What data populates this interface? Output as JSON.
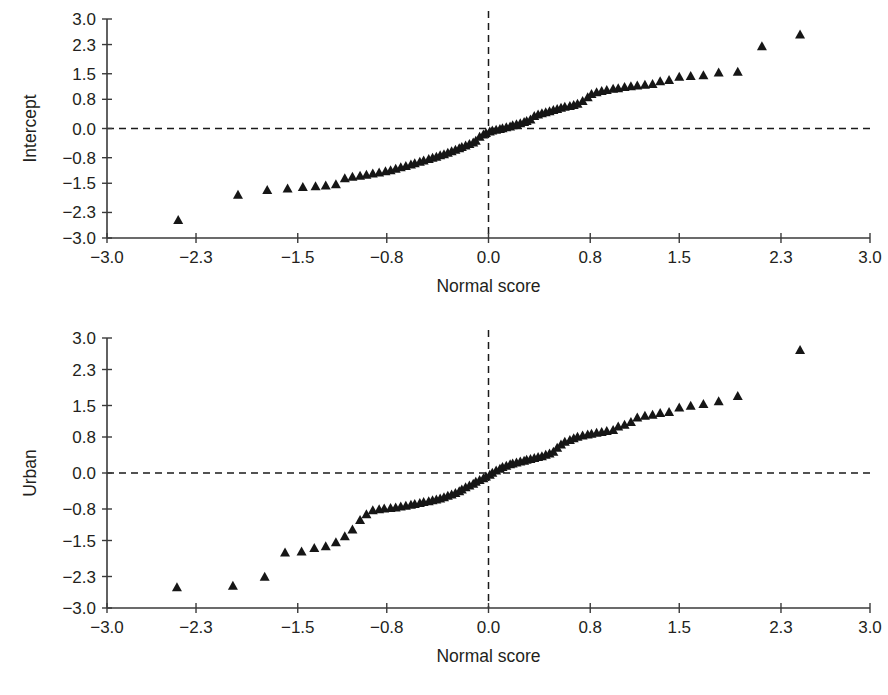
{
  "figure": {
    "background_color": "#ffffff",
    "marker_color": "#161616",
    "axis_color": "#3a3a3a"
  },
  "chart_data": [
    {
      "type": "scatter",
      "title": "",
      "subtitle": "",
      "xlabel": "Normal score",
      "ylabel": "Intercept",
      "xlim": [
        -3.0,
        3.0
      ],
      "ylim": [
        -3.0,
        3.0
      ],
      "xticks": [
        -3.0,
        -2.3,
        -1.5,
        -0.8,
        0.0,
        0.8,
        1.5,
        2.3,
        3.0
      ],
      "yticks": [
        -3.0,
        -2.3,
        -1.5,
        -0.8,
        0.0,
        0.8,
        1.5,
        2.3,
        3.0
      ],
      "xtick_labels": [
        "−3.0",
        "−2.3",
        "−1.5",
        "−0.8",
        "0.0",
        "0.8",
        "1.5",
        "2.3",
        "3.0"
      ],
      "ytick_labels": [
        "−3.0",
        "−2.3",
        "−1.5",
        "−0.8",
        "0.0",
        "0.8",
        "1.5",
        "2.3",
        "3.0"
      ],
      "grid": false,
      "legend": null,
      "annotations": [
        {
          "name": "horizontal-zero-reference",
          "type": "hline",
          "y": 0.0,
          "style": "dashed"
        },
        {
          "name": "vertical-zero-reference",
          "type": "vline",
          "x": 0.0,
          "style": "dashed"
        }
      ],
      "marker": "triangle-up",
      "points": [
        [
          -2.44,
          -2.52
        ],
        [
          -1.97,
          -1.83
        ],
        [
          -1.74,
          -1.7
        ],
        [
          -1.58,
          -1.66
        ],
        [
          -1.46,
          -1.62
        ],
        [
          -1.36,
          -1.6
        ],
        [
          -1.28,
          -1.58
        ],
        [
          -1.2,
          -1.54
        ],
        [
          -1.13,
          -1.38
        ],
        [
          -1.07,
          -1.34
        ],
        [
          -1.01,
          -1.31
        ],
        [
          -0.96,
          -1.28
        ],
        [
          -0.91,
          -1.25
        ],
        [
          -0.86,
          -1.22
        ],
        [
          -0.81,
          -1.19
        ],
        [
          -0.77,
          -1.16
        ],
        [
          -0.73,
          -1.12
        ],
        [
          -0.69,
          -1.08
        ],
        [
          -0.65,
          -1.04
        ],
        [
          -0.61,
          -1.0
        ],
        [
          -0.58,
          -0.97
        ],
        [
          -0.54,
          -0.93
        ],
        [
          -0.51,
          -0.89
        ],
        [
          -0.47,
          -0.85
        ],
        [
          -0.44,
          -0.82
        ],
        [
          -0.41,
          -0.79
        ],
        [
          -0.38,
          -0.75
        ],
        [
          -0.35,
          -0.72
        ],
        [
          -0.32,
          -0.68
        ],
        [
          -0.29,
          -0.64
        ],
        [
          -0.26,
          -0.6
        ],
        [
          -0.23,
          -0.56
        ],
        [
          -0.21,
          -0.52
        ],
        [
          -0.18,
          -0.48
        ],
        [
          -0.15,
          -0.44
        ],
        [
          -0.12,
          -0.4
        ],
        [
          -0.1,
          -0.35
        ],
        [
          -0.07,
          -0.24
        ],
        [
          -0.04,
          -0.18
        ],
        [
          -0.02,
          -0.14
        ],
        [
          0.01,
          -0.1
        ],
        [
          0.03,
          -0.07
        ],
        [
          0.06,
          -0.05
        ],
        [
          0.09,
          -0.03
        ],
        [
          0.11,
          -0.01
        ],
        [
          0.14,
          0.02
        ],
        [
          0.17,
          0.04
        ],
        [
          0.19,
          0.07
        ],
        [
          0.22,
          0.1
        ],
        [
          0.25,
          0.13
        ],
        [
          0.28,
          0.16
        ],
        [
          0.3,
          0.19
        ],
        [
          0.33,
          0.23
        ],
        [
          0.36,
          0.33
        ],
        [
          0.39,
          0.37
        ],
        [
          0.42,
          0.4
        ],
        [
          0.45,
          0.43
        ],
        [
          0.48,
          0.46
        ],
        [
          0.51,
          0.49
        ],
        [
          0.54,
          0.52
        ],
        [
          0.57,
          0.55
        ],
        [
          0.6,
          0.58
        ],
        [
          0.64,
          0.6
        ],
        [
          0.67,
          0.63
        ],
        [
          0.7,
          0.66
        ],
        [
          0.74,
          0.74
        ],
        [
          0.78,
          0.84
        ],
        [
          0.81,
          0.93
        ],
        [
          0.85,
          0.98
        ],
        [
          0.89,
          1.01
        ],
        [
          0.93,
          1.04
        ],
        [
          0.98,
          1.07
        ],
        [
          1.02,
          1.09
        ],
        [
          1.07,
          1.12
        ],
        [
          1.12,
          1.14
        ],
        [
          1.17,
          1.16
        ],
        [
          1.23,
          1.18
        ],
        [
          1.29,
          1.2
        ],
        [
          1.35,
          1.28
        ],
        [
          1.42,
          1.31
        ],
        [
          1.5,
          1.4
        ],
        [
          1.59,
          1.42
        ],
        [
          1.69,
          1.44
        ],
        [
          1.81,
          1.52
        ],
        [
          1.96,
          1.54
        ],
        [
          2.15,
          2.24
        ],
        [
          2.45,
          2.56
        ]
      ]
    },
    {
      "type": "scatter",
      "title": "",
      "subtitle": "",
      "xlabel": "Normal score",
      "ylabel": "Urban",
      "xlim": [
        -3.0,
        3.0
      ],
      "ylim": [
        -3.0,
        3.0
      ],
      "xticks": [
        -3.0,
        -2.3,
        -1.5,
        -0.8,
        0.0,
        0.8,
        1.5,
        2.3,
        3.0
      ],
      "yticks": [
        -3.0,
        -2.3,
        -1.5,
        -0.8,
        0.0,
        0.8,
        1.5,
        2.3,
        3.0
      ],
      "xtick_labels": [
        "−3.0",
        "−2.3",
        "−1.5",
        "−0.8",
        "0.0",
        "0.8",
        "1.5",
        "2.3",
        "3.0"
      ],
      "ytick_labels": [
        "−3.0",
        "−2.3",
        "−1.5",
        "−0.8",
        "0.0",
        "0.8",
        "1.5",
        "2.3",
        "3.0"
      ],
      "grid": false,
      "legend": null,
      "annotations": [
        {
          "name": "horizontal-zero-reference",
          "type": "hline",
          "y": 0.0,
          "style": "dashed"
        },
        {
          "name": "vertical-zero-reference",
          "type": "vline",
          "x": 0.0,
          "style": "dashed"
        }
      ],
      "marker": "triangle-up",
      "points": [
        [
          -2.45,
          -2.55
        ],
        [
          -2.01,
          -2.52
        ],
        [
          -1.76,
          -2.32
        ],
        [
          -1.6,
          -1.78
        ],
        [
          -1.47,
          -1.76
        ],
        [
          -1.37,
          -1.68
        ],
        [
          -1.28,
          -1.64
        ],
        [
          -1.2,
          -1.55
        ],
        [
          -1.13,
          -1.42
        ],
        [
          -1.07,
          -1.27
        ],
        [
          -1.01,
          -1.06
        ],
        [
          -0.96,
          -0.93
        ],
        [
          -0.91,
          -0.84
        ],
        [
          -0.86,
          -0.82
        ],
        [
          -0.82,
          -0.8
        ],
        [
          -0.77,
          -0.79
        ],
        [
          -0.73,
          -0.78
        ],
        [
          -0.69,
          -0.76
        ],
        [
          -0.65,
          -0.74
        ],
        [
          -0.61,
          -0.72
        ],
        [
          -0.58,
          -0.7
        ],
        [
          -0.54,
          -0.68
        ],
        [
          -0.51,
          -0.66
        ],
        [
          -0.47,
          -0.64
        ],
        [
          -0.44,
          -0.62
        ],
        [
          -0.41,
          -0.6
        ],
        [
          -0.38,
          -0.58
        ],
        [
          -0.35,
          -0.55
        ],
        [
          -0.32,
          -0.52
        ],
        [
          -0.29,
          -0.49
        ],
        [
          -0.26,
          -0.46
        ],
        [
          -0.23,
          -0.42
        ],
        [
          -0.21,
          -0.38
        ],
        [
          -0.18,
          -0.33
        ],
        [
          -0.15,
          -0.29
        ],
        [
          -0.12,
          -0.25
        ],
        [
          -0.1,
          -0.21
        ],
        [
          -0.07,
          -0.17
        ],
        [
          -0.04,
          -0.13
        ],
        [
          -0.02,
          -0.09
        ],
        [
          0.01,
          -0.05
        ],
        [
          0.03,
          -0.01
        ],
        [
          0.06,
          0.04
        ],
        [
          0.09,
          0.08
        ],
        [
          0.11,
          0.12
        ],
        [
          0.14,
          0.15
        ],
        [
          0.17,
          0.18
        ],
        [
          0.19,
          0.2
        ],
        [
          0.22,
          0.22
        ],
        [
          0.25,
          0.24
        ],
        [
          0.28,
          0.26
        ],
        [
          0.3,
          0.28
        ],
        [
          0.33,
          0.3
        ],
        [
          0.36,
          0.32
        ],
        [
          0.39,
          0.34
        ],
        [
          0.42,
          0.36
        ],
        [
          0.45,
          0.39
        ],
        [
          0.48,
          0.42
        ],
        [
          0.51,
          0.46
        ],
        [
          0.54,
          0.55
        ],
        [
          0.57,
          0.62
        ],
        [
          0.6,
          0.68
        ],
        [
          0.64,
          0.72
        ],
        [
          0.67,
          0.76
        ],
        [
          0.7,
          0.79
        ],
        [
          0.74,
          0.82
        ],
        [
          0.78,
          0.84
        ],
        [
          0.81,
          0.86
        ],
        [
          0.85,
          0.88
        ],
        [
          0.89,
          0.9
        ],
        [
          0.93,
          0.92
        ],
        [
          0.98,
          0.94
        ],
        [
          1.02,
          1.02
        ],
        [
          1.07,
          1.06
        ],
        [
          1.12,
          1.12
        ],
        [
          1.17,
          1.22
        ],
        [
          1.23,
          1.26
        ],
        [
          1.29,
          1.28
        ],
        [
          1.35,
          1.32
        ],
        [
          1.42,
          1.34
        ],
        [
          1.5,
          1.44
        ],
        [
          1.59,
          1.48
        ],
        [
          1.69,
          1.52
        ],
        [
          1.81,
          1.58
        ],
        [
          1.96,
          1.7
        ],
        [
          2.45,
          2.72
        ]
      ]
    }
  ]
}
